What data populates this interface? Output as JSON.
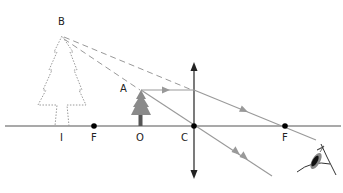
{
  "diagram": {
    "type": "convex-lens-virtual-image",
    "labels": {
      "B": "B",
      "A": "A",
      "I": "I",
      "F_left": "F",
      "O": "O",
      "C": "C",
      "F_right": "F"
    },
    "colors": {
      "axis": "#555555",
      "ray": "#999999",
      "lens": "#333333",
      "point": "#000000",
      "tree_real": "#777777",
      "tree_virtual": "#9a9a9a"
    },
    "points": {
      "C": [
        194,
        126
      ],
      "F_left": [
        94,
        126
      ],
      "F_right": [
        285,
        126
      ],
      "O": [
        140,
        126
      ],
      "A": [
        141,
        90
      ],
      "I": [
        62,
        126
      ],
      "B": [
        62,
        36
      ]
    }
  }
}
